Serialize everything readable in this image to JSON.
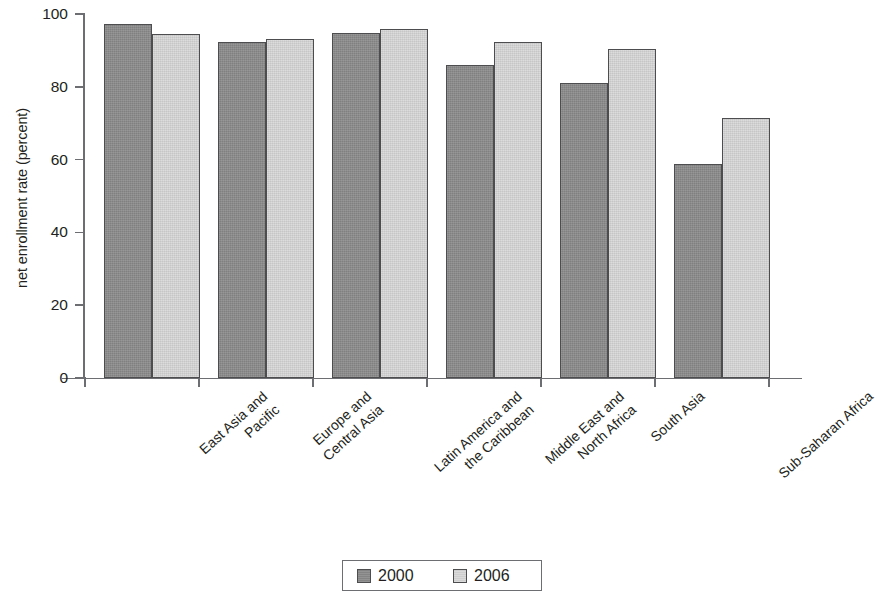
{
  "chart_data": {
    "type": "bar",
    "title": "",
    "xlabel": "",
    "ylabel": "net enrollment rate (percent)",
    "ylim": [
      0,
      100
    ],
    "ytick_labels": [
      "0",
      "20",
      "40",
      "60",
      "80",
      "100"
    ],
    "yticks": [
      0,
      20,
      40,
      60,
      80,
      100
    ],
    "grid": false,
    "legend_position": "bottom",
    "categories": [
      "East Asia and Pacific",
      "Europe and Central Asia",
      "Latin America and the Caribbean",
      "Middle East and North Africa",
      "South Asia",
      "Sub-Saharan Africa"
    ],
    "category_lines": [
      [
        "East Asia and",
        "Pacific"
      ],
      [
        "Europe and",
        "Central Asia"
      ],
      [
        "Latin America and",
        "the Caribbean"
      ],
      [
        "Middle East and",
        "North Africa"
      ],
      [
        "South Asia",
        ""
      ],
      [
        "Sub-Saharan Africa",
        ""
      ]
    ],
    "series": [
      {
        "name": "2000",
        "color": "#8b8b8b",
        "values": [
          97.3,
          92.2,
          94.9,
          86.0,
          81.0,
          58.7
        ]
      },
      {
        "name": "2006",
        "color": "#d6d6d6",
        "values": [
          94.5,
          93.2,
          96.0,
          92.3,
          90.3,
          71.5
        ]
      }
    ]
  },
  "legend": {
    "items": [
      {
        "label": "2000",
        "swatch": "dark-gray-swatch"
      },
      {
        "label": "2006",
        "swatch": "light-gray-swatch"
      }
    ]
  }
}
